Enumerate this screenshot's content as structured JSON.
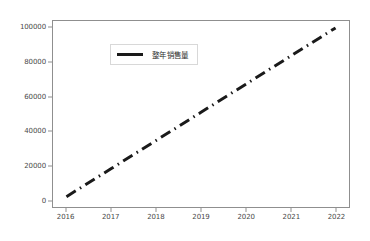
{
  "chart_data": {
    "type": "line",
    "title": "",
    "xlabel": "",
    "ylabel": "",
    "xlim": [
      2015.7,
      2022.3
    ],
    "ylim": [
      -4000,
      104000
    ],
    "grid": false,
    "legend_position": "upper left",
    "x_ticks": [
      "2016",
      "2017",
      "2018",
      "2019",
      "2020",
      "2021",
      "2022"
    ],
    "x_tick_values": [
      2016,
      2017,
      2018,
      2019,
      2020,
      2021,
      2022
    ],
    "y_ticks": [
      "0",
      "20000",
      "40000",
      "60000",
      "80000",
      "100000"
    ],
    "y_tick_values": [
      0,
      20000,
      40000,
      60000,
      80000,
      100000
    ],
    "series": [
      {
        "name": "整年销售量",
        "color": "#1a1a1a",
        "linestyle": "dash-dot",
        "linewidth": 3,
        "x": [
          2016,
          2017,
          2018,
          2019,
          2020,
          2021,
          2022
        ],
        "values": [
          2000,
          18333,
          34667,
          51000,
          67333,
          83667,
          100000
        ]
      }
    ]
  },
  "legend": {
    "label": "整年销售量",
    "swatch_color": "#1a1a1a"
  },
  "axes": {
    "frame_color": "#8f8f8f",
    "tick_label_color": "#4a4a4a"
  },
  "figure": {
    "background": "#ffffff"
  }
}
